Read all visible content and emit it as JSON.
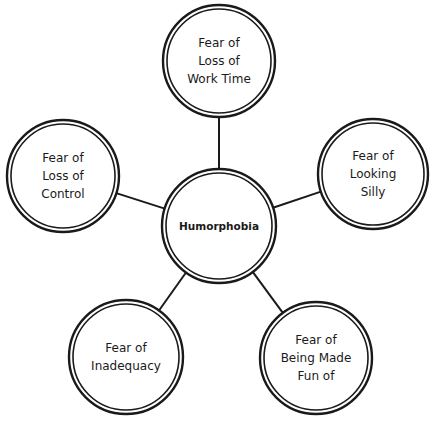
{
  "diagram": {
    "type": "mind-map",
    "colors": {
      "stroke": "#1a1a1a",
      "background": "#ffffff"
    },
    "center": {
      "label": "Humorphobia",
      "cx": 219,
      "cy": 226,
      "r": 57
    },
    "nodes": [
      {
        "id": "top",
        "lines": [
          "Fear of",
          "Loss of",
          "Work Time"
        ],
        "cx": 219,
        "cy": 61,
        "r": 56
      },
      {
        "id": "right",
        "lines": [
          "Fear of",
          "Looking",
          "Silly"
        ],
        "cx": 373,
        "cy": 174,
        "r": 55
      },
      {
        "id": "bottom-right",
        "lines": [
          "Fear of",
          "Being Made",
          "Fun of"
        ],
        "cx": 316,
        "cy": 358,
        "r": 56
      },
      {
        "id": "bottom-left",
        "lines": [
          "Fear of",
          "Inadequacy"
        ],
        "cx": 126,
        "cy": 357,
        "r": 57
      },
      {
        "id": "left",
        "lines": [
          "Fear of",
          "Loss of",
          "Control"
        ],
        "cx": 63,
        "cy": 176,
        "r": 56
      }
    ]
  }
}
